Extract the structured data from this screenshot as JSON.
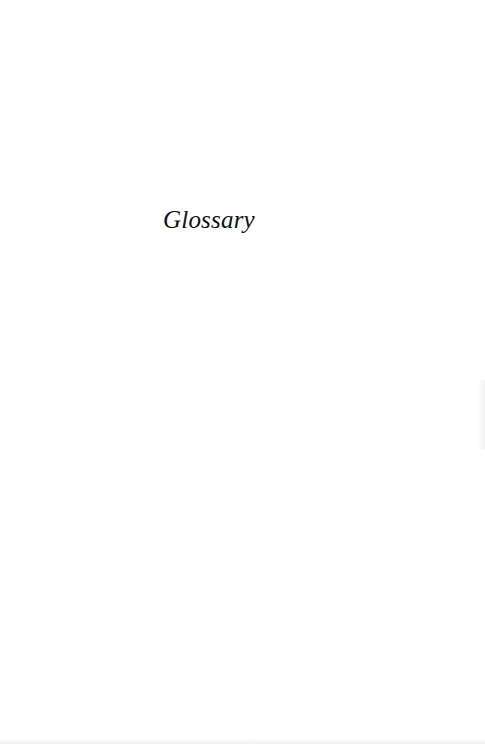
{
  "page": {
    "title": "Glossary"
  },
  "colors": {
    "background": "#ffffff",
    "text": "#111111"
  }
}
